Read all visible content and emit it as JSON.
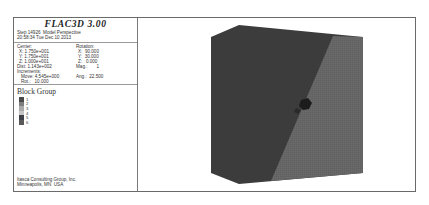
{
  "legend": {
    "title": "FLAC3D 3.00",
    "step_line": "Step 14926  Model Perspective",
    "date_line": "20:58:34 Tue Dec 10 2013",
    "center": {
      "label": "Center:",
      "x": "X: 1.750e+001",
      "y": "Y: 1.750e+001",
      "z": "Z: 1.000e+001"
    },
    "rotation": {
      "label": "Rotation:",
      "x": "X:  90.000",
      "y": "Y:  30.000",
      "z": "Z:   0.000"
    },
    "dist": "Dist: 1.143e+002",
    "mag": "Mag.:       1",
    "increments": "Increments:",
    "move": "Move: 4.545e+000",
    "ang": "Ang.:  22.500",
    "rot": "Rot.:   10.000",
    "block_group": {
      "title": "Block Group",
      "items": [
        {
          "label": "1",
          "color": "#4a4a4a"
        },
        {
          "label": "2",
          "color": "#7d7d7d"
        },
        {
          "label": "3",
          "color": "#a9a9a9"
        },
        {
          "label": "4",
          "color": "#c4c4c4"
        },
        {
          "label": "5",
          "color": "#3e4048"
        },
        {
          "label": "6",
          "color": "#5a5a5a"
        }
      ]
    },
    "company": "Itasca Consulting Group, Inc.",
    "location": "Minneapolis, MN  USA"
  },
  "model": {
    "dark_color": "#3d3d3d",
    "light_color": "#6b6b6b",
    "mesh_color": "#595959"
  }
}
